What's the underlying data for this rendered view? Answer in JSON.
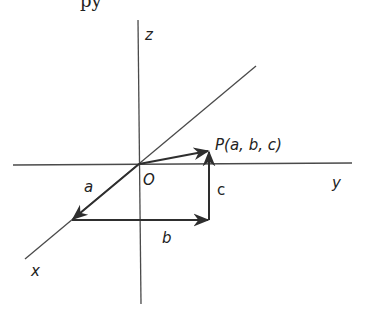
{
  "diagram": {
    "title_fragment": "py",
    "axes": {
      "x_label": "x",
      "y_label": "y",
      "z_label": "z",
      "origin_label": "O"
    },
    "point": {
      "label": "P(a, b, c)"
    },
    "components": {
      "a_label": "a",
      "b_label": "b",
      "c_label": "c"
    },
    "colors": {
      "axis": "#4a4a4a",
      "vector": "#2e2e2e",
      "text": "#222222",
      "background": "#ffffff"
    }
  }
}
